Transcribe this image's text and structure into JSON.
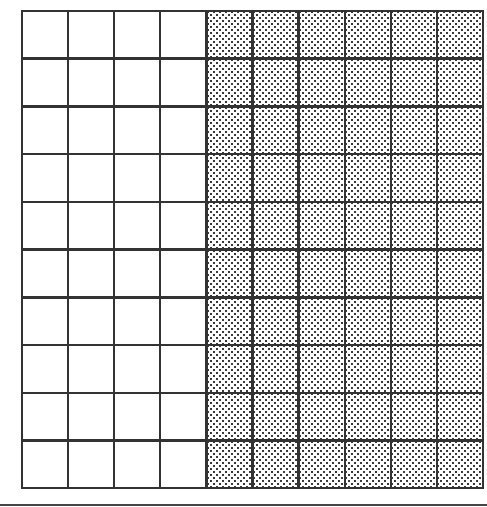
{
  "figure": {
    "type": "hundred-grid",
    "rows": 10,
    "columns": 10,
    "total_squares": 100,
    "shaded_columns": 6,
    "unshaded_columns": 4,
    "shaded_squares": 60,
    "unshaded_squares": 40,
    "shaded_fraction": "60/100",
    "shading_pattern": "dotted",
    "shaded_side": "right",
    "colors": {
      "line": "#333333",
      "background": "#ffffff",
      "dot": "#3a3a3a"
    }
  }
}
